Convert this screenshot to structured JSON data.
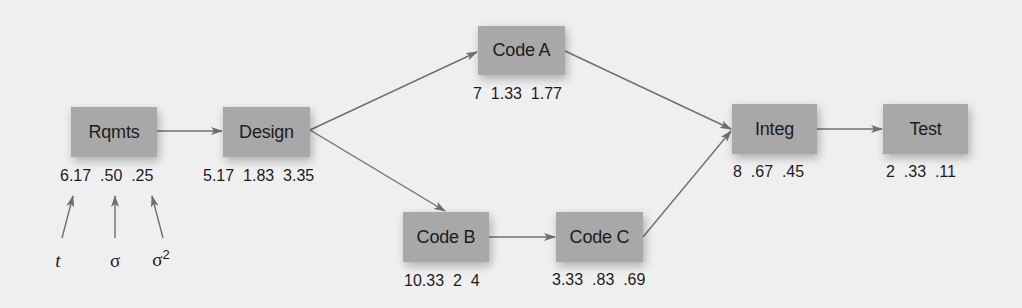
{
  "diagram": {
    "type": "activity-network",
    "nodes": [
      {
        "id": "rqmts",
        "label": "Rqmts",
        "t": "6.17",
        "sigma": ".50",
        "variance": ".25",
        "stats_text": "6.17  .50  .25"
      },
      {
        "id": "design",
        "label": "Design",
        "t": "5.17",
        "sigma": "1.83",
        "variance": "3.35",
        "stats_text": "5.17  1.83  3.35"
      },
      {
        "id": "code_a",
        "label": "Code A",
        "t": "7",
        "sigma": "1.33",
        "variance": "1.77",
        "stats_text": "7  1.33  1.77"
      },
      {
        "id": "code_b",
        "label": "Code B",
        "t": "10.33",
        "sigma": "2",
        "variance": "4",
        "stats_text": "10.33  2  4"
      },
      {
        "id": "code_c",
        "label": "Code C",
        "t": "3.33",
        "sigma": ".83",
        "variance": ".69",
        "stats_text": "3.33  .83  .69"
      },
      {
        "id": "integ",
        "label": "Integ",
        "t": "8",
        "sigma": ".67",
        "variance": ".45",
        "stats_text": "8  .67  .45"
      },
      {
        "id": "test",
        "label": "Test",
        "t": "2",
        "sigma": ".33",
        "variance": ".11",
        "stats_text": "2  .33  .11"
      }
    ],
    "edges": [
      {
        "from": "rqmts",
        "to": "design"
      },
      {
        "from": "design",
        "to": "code_a"
      },
      {
        "from": "design",
        "to": "code_b"
      },
      {
        "from": "code_b",
        "to": "code_c"
      },
      {
        "from": "code_a",
        "to": "integ"
      },
      {
        "from": "code_c",
        "to": "integ"
      },
      {
        "from": "integ",
        "to": "test"
      }
    ],
    "legend": {
      "t": "t",
      "sigma": "σ",
      "variance_base": "σ",
      "variance_exp": "2"
    },
    "colors": {
      "background": "#efefef",
      "node_fill": "#a8a8a8",
      "edge": "#6f6f6f",
      "text": "#1c1c1c"
    }
  }
}
